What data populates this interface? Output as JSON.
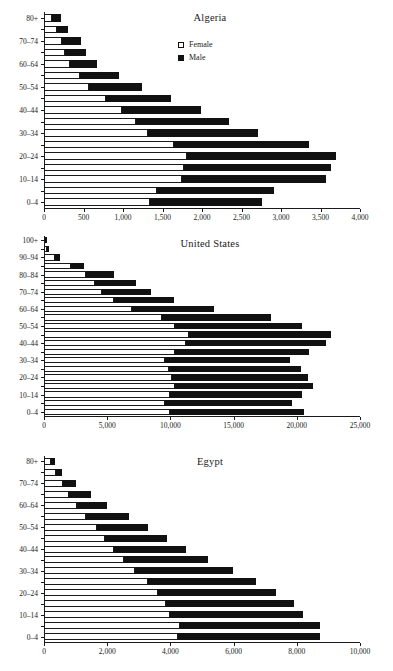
{
  "figure": {
    "legend": {
      "female_label": "Female",
      "male_label": "Male",
      "female_color": "#ffffff",
      "male_color": "#111111"
    }
  },
  "chart_data": [
    {
      "type": "bar",
      "subtype": "population-pyramid-stacked",
      "title": "Algeria",
      "xlabel": "",
      "ylabel": "",
      "orientation": "horizontal",
      "stacked": true,
      "grid": false,
      "legend_position": "inside-top-right",
      "xlim": [
        0,
        4000
      ],
      "xticks": [
        0,
        500,
        1000,
        1500,
        2000,
        2500,
        3000,
        3500,
        4000
      ],
      "xticklabels": [
        "0",
        "500",
        "1,000",
        "1,500",
        "2,000",
        "2,500",
        "3,000",
        "3,500",
        "4,000"
      ],
      "categories": [
        "0-4",
        "5-9",
        "10-14",
        "15-19",
        "20-24",
        "25-29",
        "30-34",
        "35-39",
        "40-44",
        "45-49",
        "50-54",
        "55-59",
        "60-64",
        "65-69",
        "70-74",
        "75-79",
        "80+"
      ],
      "yticklabels": [
        "0-4",
        "",
        "10-14",
        "",
        "20-24",
        "",
        "30-34",
        "",
        "40-44",
        "",
        "50-54",
        "",
        "60-64",
        "",
        "70-74",
        "",
        "80+"
      ],
      "series": [
        {
          "name": "Female",
          "values": [
            1345,
            1430,
            1745,
            1770,
            1810,
            1640,
            1320,
            1165,
            985,
            790,
            575,
            455,
            335,
            265,
            225,
            160,
            105
          ]
        },
        {
          "name": "Male",
          "values": [
            1420,
            1485,
            1820,
            1865,
            1885,
            1710,
            1385,
            1180,
            1005,
            815,
            660,
            490,
            330,
            270,
            240,
            140,
            110
          ]
        }
      ],
      "totals": [
        2765,
        2915,
        3565,
        3635,
        3695,
        3350,
        2705,
        2345,
        1990,
        1605,
        1235,
        945,
        665,
        535,
        465,
        300,
        215
      ]
    },
    {
      "type": "bar",
      "subtype": "population-pyramid-stacked",
      "title": "United States",
      "xlabel": "",
      "ylabel": "",
      "orientation": "horizontal",
      "stacked": true,
      "grid": false,
      "xlim": [
        0,
        25000
      ],
      "xticks": [
        0,
        5000,
        10000,
        15000,
        20000,
        25000
      ],
      "xticklabels": [
        "0",
        "5,000",
        "10,000",
        "15,000",
        "20,000",
        "25,000"
      ],
      "categories": [
        "0-4",
        "5-9",
        "10-14",
        "15-19",
        "20-24",
        "25-29",
        "30-34",
        "35-39",
        "40-44",
        "45-49",
        "50-54",
        "55-59",
        "60-64",
        "65-69",
        "70-74",
        "75-79",
        "80-84",
        "85-89",
        "90-94",
        "95-99",
        "100+"
      ],
      "yticklabels": [
        "0-4",
        "",
        "10-14",
        "",
        "20-24",
        "",
        "30-34",
        "",
        "40-44",
        "",
        "50-54",
        "",
        "60-64",
        "",
        "70-74",
        "",
        "80-84",
        "",
        "90-94",
        "",
        "100+"
      ],
      "series": [
        {
          "name": "Female",
          "values": [
            10000,
            9600,
            10000,
            10350,
            10100,
            9900,
            9600,
            10350,
            11200,
            11450,
            10400,
            9350,
            6950,
            5500,
            4600,
            4050,
            3350,
            2150,
            900,
            250,
            60
          ]
        },
        {
          "name": "Male",
          "values": [
            10600,
            10050,
            10450,
            10950,
            10750,
            10400,
            9850,
            10650,
            11150,
            11250,
            10050,
            8600,
            6500,
            4800,
            3850,
            3200,
            2150,
            1050,
            400,
            90,
            20
          ]
        }
      ],
      "totals": [
        20600,
        19650,
        20450,
        21300,
        20850,
        20300,
        19450,
        21000,
        22350,
        22700,
        20450,
        17950,
        13450,
        10300,
        8450,
        7250,
        5500,
        3200,
        1300,
        340,
        80
      ]
    },
    {
      "type": "bar",
      "subtype": "population-pyramid-stacked",
      "title": "Egypt",
      "xlabel": "",
      "ylabel": "",
      "orientation": "horizontal",
      "stacked": true,
      "grid": false,
      "xlim": [
        0,
        10000
      ],
      "xticks": [
        0,
        2000,
        4000,
        6000,
        8000,
        10000
      ],
      "xticklabels": [
        "0",
        "2,000",
        "4,000",
        "6,000",
        "8,000",
        "10,000"
      ],
      "categories": [
        "0-4",
        "5-9",
        "10-14",
        "15-19",
        "20-24",
        "25-29",
        "30-34",
        "35-39",
        "40-44",
        "45-49",
        "50-54",
        "55-59",
        "60-64",
        "65-69",
        "70-74",
        "75-79",
        "80+"
      ],
      "yticklabels": [
        "0-4",
        "",
        "10-14",
        "",
        "20-24",
        "",
        "30-34",
        "",
        "40-44",
        "",
        "50-54",
        "",
        "60-64",
        "",
        "70-74",
        "",
        "80+"
      ],
      "series": [
        {
          "name": "Female",
          "values": [
            4250,
            4300,
            4000,
            3850,
            3600,
            3300,
            2880,
            2520,
            2230,
            1930,
            1680,
            1340,
            1030,
            790,
            590,
            370,
            220
          ]
        },
        {
          "name": "Male",
          "values": [
            4500,
            4450,
            4200,
            4050,
            3730,
            3400,
            3100,
            2680,
            2250,
            1950,
            1620,
            1340,
            960,
            690,
            430,
            210,
            140
          ]
        }
      ],
      "totals": [
        8750,
        8750,
        8200,
        7900,
        7330,
        6700,
        5980,
        5200,
        4480,
        3880,
        3300,
        2680,
        1990,
        1480,
        1020,
        580,
        360
      ]
    }
  ]
}
